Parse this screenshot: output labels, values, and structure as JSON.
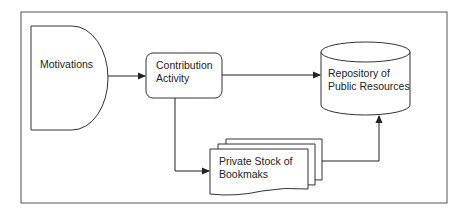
{
  "diagram": {
    "nodes": [
      {
        "id": "motivations",
        "label_lines": [
          "Motivations"
        ],
        "shape": "delay"
      },
      {
        "id": "contribution",
        "label_lines": [
          "Contribution",
          "Activity"
        ],
        "shape": "rounded-rect"
      },
      {
        "id": "repository",
        "label_lines": [
          "Repository of",
          "Public Resources"
        ],
        "shape": "cylinder"
      },
      {
        "id": "private_stock",
        "label_lines": [
          "Private Stock of",
          "Bookmaks"
        ],
        "shape": "multi-document"
      }
    ],
    "edges": [
      {
        "from": "motivations",
        "to": "contribution"
      },
      {
        "from": "contribution",
        "to": "repository"
      },
      {
        "from": "contribution",
        "to": "private_stock"
      },
      {
        "from": "private_stock",
        "to": "repository"
      }
    ],
    "colors": {
      "stroke": "#333333",
      "background": "#ffffff",
      "frame": "#555555"
    }
  }
}
